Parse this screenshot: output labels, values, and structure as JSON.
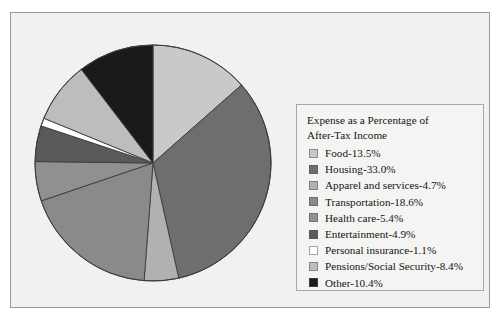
{
  "chart_data": {
    "type": "pie",
    "title": "Expense as a Percentage of\nAfter-Tax Income",
    "xlabel": "",
    "ylabel": "",
    "legend_position": "right",
    "grid": false,
    "start_angle_deg": 0,
    "direction": "clockwise",
    "categories": [
      "Food",
      "Housing",
      "Apparel and services",
      "Transportation",
      "Health care",
      "Entertainment",
      "Personal insurance",
      "Pensions/Social Security",
      "Other"
    ],
    "values": [
      13.5,
      33.0,
      4.7,
      18.6,
      5.4,
      4.9,
      1.1,
      8.4,
      10.4
    ],
    "units": "percent",
    "colors": [
      "#c9c9c9",
      "#6e6e6e",
      "#b1b1b1",
      "#8a8a8a",
      "#909090",
      "#5a5a5a",
      "#ffffff",
      "#bdbdbd",
      "#1a1a1a"
    ],
    "slice_labels": [
      "Food-13.5%",
      "Housing-33.0%",
      "Apparel and services-4.7%",
      "Transportation-18.6%",
      "Health care-5.4%",
      "Entertainment-4.9%",
      "Personal insurance-1.1%",
      "Pensions/Social Security-8.4%",
      "Other-10.4%"
    ]
  },
  "legend": {
    "title": "Expense as a Percentage of\nAfter-Tax Income",
    "entries": [
      {
        "label": "Food-13.5%",
        "color": "#c9c9c9"
      },
      {
        "label": "Housing-33.0%",
        "color": "#6e6e6e"
      },
      {
        "label": "Apparel and services-4.7%",
        "color": "#b1b1b1"
      },
      {
        "label": "Transportation-18.6%",
        "color": "#8a8a8a"
      },
      {
        "label": "Health care-5.4%",
        "color": "#909090"
      },
      {
        "label": "Entertainment-4.9%",
        "color": "#5a5a5a"
      },
      {
        "label": "Personal insurance-1.1%",
        "color": "#ffffff"
      },
      {
        "label": "Pensions/Social Security-8.4%",
        "color": "#bdbdbd"
      },
      {
        "label": "Other-10.4%",
        "color": "#1a1a1a"
      }
    ]
  },
  "figure": {
    "background": "#f1f1f0",
    "border_color": "#9a9a9a",
    "pie_outline_color": "#3c3c3c"
  }
}
